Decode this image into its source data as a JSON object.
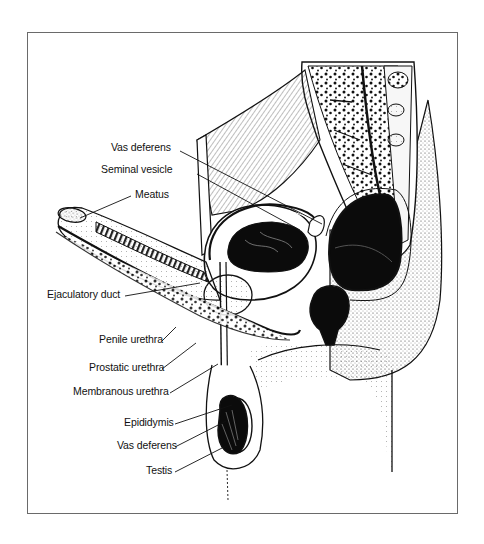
{
  "figure": {
    "type": "anatomical-illustration",
    "colors": {
      "ink": "#111111",
      "frame": "#6a6a6a",
      "background": "#ffffff"
    }
  },
  "labels": [
    {
      "id": "vas-deferens-upper",
      "text": "Vas deferens",
      "x": 111,
      "y": 148,
      "target_x": 322,
      "target_y": 224
    },
    {
      "id": "seminal-vesicle",
      "text": "Seminal vesicle",
      "x": 101,
      "y": 170,
      "target_x": 300,
      "target_y": 230
    },
    {
      "id": "meatus",
      "text": "Meatus",
      "x": 135,
      "y": 195,
      "target_x": 80,
      "target_y": 218
    },
    {
      "id": "ejaculatory-duct",
      "text": "Ejaculatory duct",
      "x": 47,
      "y": 293,
      "target_x": 200,
      "target_y": 283
    },
    {
      "id": "penile-urethra",
      "text": "Penile urethra",
      "x": 99,
      "y": 338,
      "target_x": 176,
      "target_y": 327
    },
    {
      "id": "prostatic-urethra",
      "text": "Prostatic urethra",
      "x": 89,
      "y": 366,
      "target_x": 196,
      "target_y": 343
    },
    {
      "id": "membranous-urethra",
      "text": "Membranous urethra",
      "x": 73,
      "y": 390,
      "target_x": 218,
      "target_y": 364
    },
    {
      "id": "epididymis",
      "text": "Epididymis",
      "x": 124,
      "y": 421,
      "target_x": 232,
      "target_y": 405
    },
    {
      "id": "vas-deferens-lower",
      "text": "Vas deferens",
      "x": 117,
      "y": 444,
      "target_x": 226,
      "target_y": 421
    },
    {
      "id": "testis",
      "text": "Testis",
      "x": 146,
      "y": 469,
      "target_x": 226,
      "target_y": 446
    }
  ]
}
